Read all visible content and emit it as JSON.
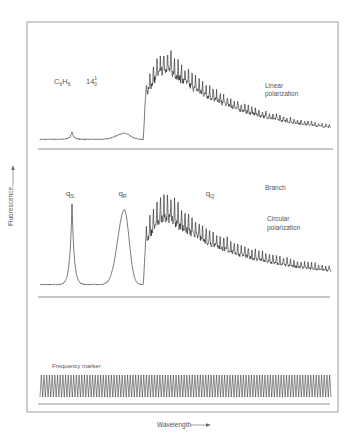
{
  "chart_data": {
    "type": "line",
    "title": "",
    "molecule_label": {
      "main": "C",
      "sub1": "6",
      "mid": "H",
      "sub2": "6"
    },
    "transition_label": {
      "main": "14",
      "sup": "1",
      "sub": "0"
    },
    "ylabel": "Fluorescence",
    "xlabel": "Wavelength",
    "branch_label": "Branch",
    "branch_markers": [
      {
        "main": "q",
        "sub": "S",
        "x": 0.11
      },
      {
        "main": "q",
        "sub": "R",
        "x": 0.29
      },
      {
        "main": "q",
        "sub": "Q",
        "x": 0.59
      }
    ],
    "panels": [
      {
        "name": "Linear polarization",
        "label_line1": "Linear",
        "label_line2": "polarization",
        "peaks": [
          {
            "center": 0.11,
            "height": 0.08,
            "width": 0.012,
            "type": "sharp"
          },
          {
            "center": 0.29,
            "height": 0.07,
            "width": 0.03,
            "type": "broad"
          }
        ],
        "band": {
          "onset": 0.355,
          "peak": 0.44,
          "max": 0.93,
          "end": 1.0,
          "end_level": 0.06,
          "ripple": 0.22
        }
      },
      {
        "name": "Circular polarization",
        "label_line1": "Circular",
        "label_line2": "polarization",
        "peaks": [
          {
            "center": 0.11,
            "height": 0.95,
            "width": 0.012,
            "type": "sharp"
          },
          {
            "center": 0.29,
            "height": 0.88,
            "width": 0.025,
            "type": "broad"
          }
        ],
        "band": {
          "onset": 0.355,
          "peak": 0.44,
          "max": 0.93,
          "end": 1.0,
          "end_level": 0.1,
          "ripple": 0.3
        }
      },
      {
        "name": "Frequency marker",
        "label_line1": "Frequency marker",
        "label_line2": "",
        "fringe_count": 108
      }
    ],
    "x_range": [
      0,
      1
    ],
    "y_range": [
      0,
      1
    ],
    "grid": false,
    "legend": "none"
  }
}
